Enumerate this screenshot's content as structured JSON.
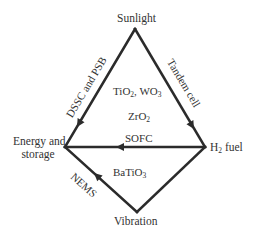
{
  "nodes": {
    "sunlight": "Sunlight",
    "energy_storage_line1": "Energy and",
    "energy_storage_line2": "storage",
    "h2_fuel_sym": "H",
    "h2_fuel_sub": "2",
    "h2_fuel_rest": " fuel",
    "vibration": "Vibration"
  },
  "edges": {
    "left_side": "DSSC and PSB",
    "right_side": "Tandem cell",
    "horizontal": "SOFC",
    "bottom_left": "NEMS"
  },
  "materials": {
    "tio2": {
      "a": "TiO",
      "a_sub": "2",
      "sep": ", WO",
      "b_sub": "3"
    },
    "zro2": {
      "a": "ZrO",
      "a_sub": "2"
    },
    "batio3": {
      "a": "BaTiO",
      "a_sub": "3"
    }
  },
  "colors": {
    "line": "#2b2b2b",
    "text": "#333333",
    "background": "#ffffff"
  }
}
